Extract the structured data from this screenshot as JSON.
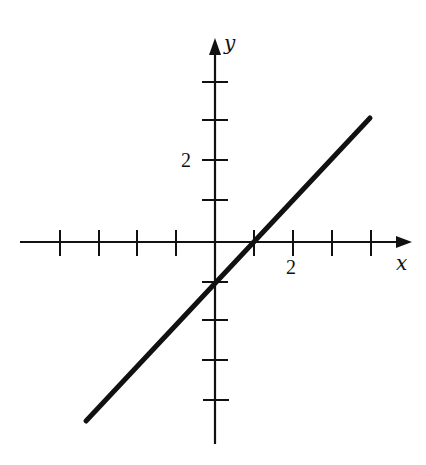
{
  "diagram": {
    "type": "coordinate-plane-line",
    "equation": "y = x - 1",
    "axes": {
      "x_label": "x",
      "y_label": "y",
      "x_ticks": [
        -4,
        -3,
        -2,
        -1,
        1,
        2,
        3,
        4
      ],
      "y_ticks": [
        -4,
        -3,
        -2,
        -1,
        1,
        2,
        3,
        4
      ],
      "labeled_ticks": {
        "x": "2",
        "y": "2"
      }
    },
    "line": {
      "slope": 1,
      "y_intercept": -1,
      "x_intercept": 1,
      "from": [
        -3.3,
        -4.6
      ],
      "to": [
        4,
        3.2
      ]
    },
    "colors": {
      "ink": "#111111",
      "background": "#ffffff"
    }
  }
}
